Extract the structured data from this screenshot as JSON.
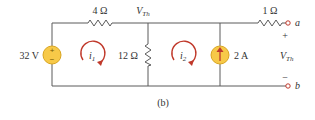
{
  "figure_label": "(b)",
  "node_label": {
    "main": "V",
    "sub": "Th"
  },
  "components": {
    "voltage_source": {
      "label": "32 V",
      "plus": "+",
      "minus": "−"
    },
    "resistor_top_left": {
      "label": "4 Ω"
    },
    "resistor_middle": {
      "label": "12 Ω"
    },
    "current_source": {
      "label": "2 A"
    },
    "resistor_top_right": {
      "label": "1 Ω"
    }
  },
  "mesh_currents": [
    {
      "main": "i",
      "sub": "1"
    },
    {
      "main": "i",
      "sub": "2"
    }
  ],
  "terminals": {
    "a": "a",
    "b": "b",
    "plus": "+",
    "minus": "−",
    "output_label": {
      "main": "V",
      "sub": "Th"
    }
  },
  "colors": {
    "wire": "#5a5a5a",
    "source_fill": "#f7c948",
    "arrow": "#c0392b"
  }
}
